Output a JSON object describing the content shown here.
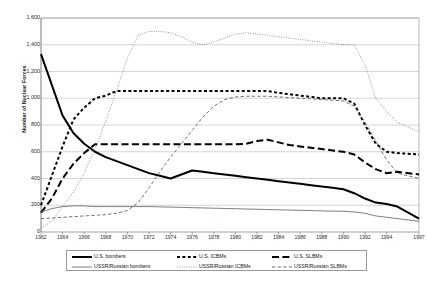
{
  "chart_data": {
    "type": "line",
    "title": "",
    "xlabel": "",
    "ylabel": "Number of Nuclear Forces",
    "ylim": [
      0,
      1600
    ],
    "ytick_step": 200,
    "grid": true,
    "legend_position": "bottom",
    "yticks": [
      "0",
      "200",
      "400",
      "600",
      "800",
      "1,000",
      "1,200",
      "1,400",
      "1,600"
    ],
    "categories": [
      1962,
      1963,
      1964,
      1965,
      1966,
      1967,
      1968,
      1969,
      1970,
      1971,
      1972,
      1973,
      1974,
      1975,
      1976,
      1977,
      1978,
      1979,
      1980,
      1981,
      1982,
      1983,
      1984,
      1985,
      1986,
      1987,
      1988,
      1989,
      1990,
      1991,
      1992,
      1993,
      1994,
      1995,
      1997
    ],
    "xticks": [
      "1962",
      "1964",
      "1966",
      "1968",
      "1970",
      "1972",
      "1974",
      "1976",
      "1978",
      "1980",
      "1982",
      "1984",
      "1986",
      "1988",
      "1990",
      "1992",
      "1994",
      "1997"
    ],
    "series": [
      {
        "name": "U.S. bombers",
        "style": "solid-thick",
        "color": "#000000",
        "values": [
          1330,
          1100,
          870,
          740,
          660,
          600,
          560,
          530,
          500,
          470,
          440,
          420,
          400,
          430,
          460,
          450,
          440,
          430,
          420,
          410,
          400,
          390,
          380,
          370,
          360,
          350,
          340,
          330,
          320,
          290,
          250,
          220,
          210,
          190,
          100
        ]
      },
      {
        "name": "U.S. ICBMs",
        "style": "dotted-thick",
        "color": "#000000",
        "values": [
          200,
          420,
          640,
          840,
          930,
          1000,
          1020,
          1054,
          1054,
          1054,
          1054,
          1054,
          1054,
          1054,
          1054,
          1054,
          1054,
          1054,
          1054,
          1054,
          1054,
          1054,
          1040,
          1030,
          1020,
          1010,
          1000,
          1000,
          1000,
          960,
          800,
          660,
          600,
          590,
          580
        ]
      },
      {
        "name": "U.S. SLBMs",
        "style": "dashed-long-thick",
        "color": "#000000",
        "values": [
          145,
          250,
          400,
          510,
          590,
          656,
          656,
          656,
          656,
          656,
          656,
          656,
          656,
          656,
          656,
          656,
          656,
          656,
          656,
          660,
          680,
          690,
          670,
          650,
          640,
          630,
          620,
          610,
          600,
          580,
          520,
          470,
          440,
          450,
          430
        ]
      },
      {
        "name": "USSR/Russian bombers",
        "style": "solid-thin",
        "color": "#555555",
        "values": [
          150,
          175,
          190,
          195,
          195,
          190,
          190,
          190,
          190,
          190,
          190,
          188,
          186,
          184,
          182,
          180,
          178,
          176,
          174,
          172,
          170,
          168,
          166,
          164,
          162,
          160,
          158,
          156,
          155,
          150,
          140,
          120,
          110,
          100,
          80
        ]
      },
      {
        "name": "USSR/Russian ICBMs",
        "style": "dotted-thin",
        "color": "#666666",
        "values": [
          30,
          80,
          190,
          300,
          440,
          620,
          830,
          1060,
          1300,
          1470,
          1500,
          1500,
          1490,
          1460,
          1420,
          1400,
          1420,
          1450,
          1480,
          1490,
          1480,
          1470,
          1460,
          1450,
          1440,
          1430,
          1420,
          1410,
          1400,
          1400,
          1250,
          1000,
          900,
          820,
          750
        ]
      },
      {
        "name": "USSR/Russian SLBMs",
        "style": "dashed-thin",
        "color": "#444444",
        "values": [
          100,
          105,
          110,
          115,
          120,
          125,
          130,
          140,
          160,
          220,
          330,
          450,
          560,
          660,
          760,
          860,
          940,
          990,
          1010,
          1015,
          1015,
          1015,
          1010,
          1005,
          1000,
          995,
          990,
          985,
          980,
          940,
          820,
          680,
          540,
          440,
          400
        ]
      }
    ]
  },
  "legend": {
    "items": [
      {
        "label": "U.S. bombers",
        "style": "solid-thick"
      },
      {
        "label": "U.S. ICBMs",
        "style": "dotted-thick"
      },
      {
        "label": "U.S. SLBMs",
        "style": "dashed-long-thick"
      },
      {
        "label": "USSR/Russian bombers",
        "style": "solid-thin"
      },
      {
        "label": "USSR/Russian ICBMs",
        "style": "dotted-thin"
      },
      {
        "label": "USSR/Russian SLBMs",
        "style": "dashed-thin"
      }
    ]
  }
}
